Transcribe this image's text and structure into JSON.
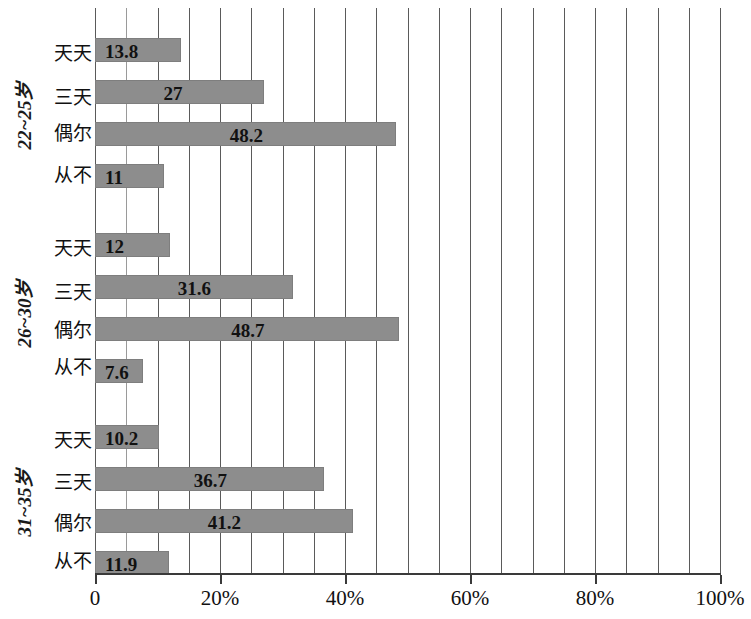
{
  "chart_data": {
    "type": "bar",
    "orientation": "horizontal",
    "title": "",
    "subtitle": "",
    "xlabel": "",
    "ylabel": "",
    "xlim": [
      0,
      100
    ],
    "grid": true,
    "legend": null,
    "grid_minor_step": 5,
    "bar_color": "#8d8d8d",
    "categories": [
      "天天",
      "三天",
      "偶尔",
      "从不"
    ],
    "groups": [
      {
        "label": "22~25岁",
        "categories": [
          "天天",
          "三天",
          "偶尔",
          "从不"
        ],
        "values": [
          13.8,
          27,
          48.2,
          11
        ],
        "value_labels": [
          "13.8",
          "27",
          "48.2",
          "11"
        ]
      },
      {
        "label": "26~30岁",
        "categories": [
          "天天",
          "三天",
          "偶尔",
          "从不"
        ],
        "values": [
          12,
          31.6,
          48.7,
          7.6
        ],
        "value_labels": [
          "12",
          "31.6",
          "48.7",
          "7.6"
        ]
      },
      {
        "label": "31~35岁",
        "categories": [
          "天天",
          "三天",
          "偶尔",
          "从不"
        ],
        "values": [
          10.2,
          36.7,
          41.2,
          11.9
        ],
        "value_labels": [
          "10.2",
          "36.7",
          "41.2",
          "11.9"
        ]
      }
    ],
    "xticks": [
      0,
      20,
      40,
      60,
      80,
      100
    ],
    "xtick_labels": [
      "0",
      "20%",
      "40%",
      "60%",
      "80%",
      "100%"
    ]
  }
}
